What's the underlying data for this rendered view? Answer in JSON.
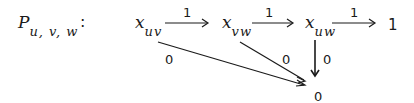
{
  "title": {
    "symbol": "P",
    "subscript": "u, v, w",
    "colon": ":"
  },
  "nodes": {
    "x_uv": {
      "base": "x",
      "sub": "uv"
    },
    "x_vw": {
      "base": "x",
      "sub": "vw"
    },
    "x_uw": {
      "base": "x",
      "sub": "uw"
    },
    "one": "1",
    "zero": "0"
  },
  "arrows": {
    "uv_to_vw": "1",
    "vw_to_uw": "1",
    "uw_to_one": "1",
    "uv_to_zero": "0",
    "vw_to_zero": "0",
    "uw_to_zero": "0"
  },
  "colors": {
    "ink": "#1a1a1a",
    "background": "#ffffff"
  }
}
